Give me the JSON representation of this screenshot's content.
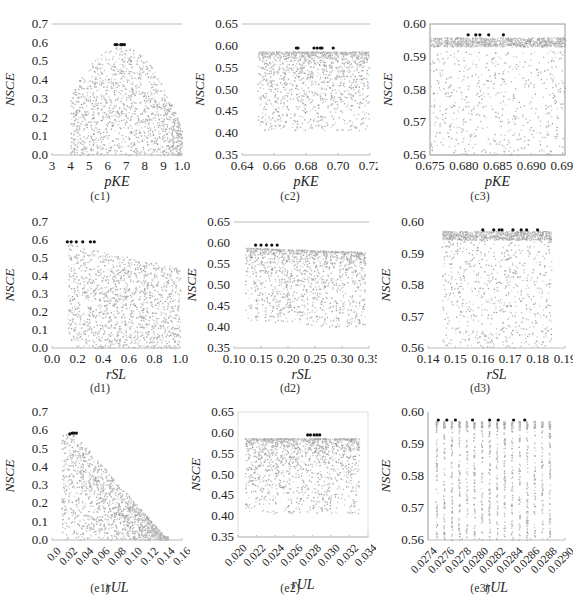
{
  "figure": {
    "panels": [
      {
        "id": "c1",
        "caption": "(c1)",
        "xlabel": "pKE",
        "ylabel": "NSCE",
        "xticks": [
          "3",
          "4",
          "5",
          "6",
          "7",
          "8",
          "9",
          "1.0"
        ],
        "yticks": [
          "0.0",
          "0.1",
          "0.2",
          "0.3",
          "0.4",
          "0.5",
          "0.6",
          "0.7"
        ]
      },
      {
        "id": "c2",
        "caption": "(c2)",
        "xlabel": "pKE",
        "ylabel": "NSCE",
        "xticks": [
          "0.64",
          "0.66",
          "0.68",
          "0.70",
          "0.72"
        ],
        "yticks": [
          "0.35",
          "0.40",
          "0.45",
          "0.50",
          "0.55",
          "0.60",
          "0.65"
        ]
      },
      {
        "id": "c3",
        "caption": "(c3)",
        "xlabel": "pKE",
        "ylabel": "NSCE",
        "xticks": [
          "0.675",
          "0.680",
          "0.685",
          "0.690",
          "0.695"
        ],
        "yticks": [
          "0.56",
          "0.57",
          "0.58",
          "0.59",
          "0.60"
        ]
      },
      {
        "id": "d1",
        "caption": "(d1)",
        "xlabel": "rSL",
        "ylabel": "NSCE",
        "xticks": [
          "0.0",
          "0.2",
          "0.4",
          "0.6",
          "0.8",
          "1.0"
        ],
        "yticks": [
          "0.0",
          "0.1",
          "0.2",
          "0.3",
          "0.4",
          "0.5",
          "0.6",
          "0.7"
        ]
      },
      {
        "id": "d2",
        "caption": "(d2)",
        "xlabel": "rSL",
        "ylabel": "NSCE",
        "xticks": [
          "0.10",
          "0.15",
          "0.20",
          "0.25",
          "0.30",
          "0.35"
        ],
        "yticks": [
          "0.35",
          "0.40",
          "0.45",
          "0.50",
          "0.55",
          "0.60",
          "0.65"
        ]
      },
      {
        "id": "d3",
        "caption": "(d3)",
        "xlabel": "rSL",
        "ylabel": "NSCE",
        "xticks": [
          "0.14",
          "0.15",
          "0.16",
          "0.17",
          "0.18",
          "0.19"
        ],
        "yticks": [
          "0.56",
          "0.57",
          "0.58",
          "0.59",
          "0.60"
        ]
      },
      {
        "id": "e1",
        "caption": "(e1)",
        "xlabel": "rUL",
        "ylabel": "NSCE",
        "xticks": [
          "0.0",
          "0.02",
          "0.04",
          "0.06",
          "0.08",
          "0.10",
          "0.12",
          "0.14",
          "0.16"
        ],
        "yticks": [
          "0.0",
          "0.1",
          "0.2",
          "0.3",
          "0.4",
          "0.5",
          "0.6",
          "0.7"
        ]
      },
      {
        "id": "e2",
        "caption": "(e2)",
        "xlabel": "rUL",
        "ylabel": "NSCE",
        "xticks": [
          "0.020",
          "0.022",
          "0.024",
          "0.026",
          "0.028",
          "0.030",
          "0.032",
          "0.034"
        ],
        "yticks": [
          "0.35",
          "0.40",
          "0.45",
          "0.50",
          "0.55",
          "0.60",
          "0.65"
        ]
      },
      {
        "id": "e3",
        "caption": "(e3)",
        "xlabel": "rUL",
        "ylabel": "NSCE",
        "xticks": [
          "0.0274",
          "0.0276",
          "0.0278",
          "0.0280",
          "0.0282",
          "0.0284",
          "0.0286",
          "0.0288",
          "0.0290"
        ],
        "yticks": [
          "0.56",
          "0.57",
          "0.58",
          "0.59",
          "0.60"
        ]
      }
    ]
  },
  "chart_data": [
    {
      "id": "c1",
      "type": "scatter",
      "title": "(c1)",
      "xlabel": "pKE",
      "ylabel": "NSCE",
      "xlim": [
        0.3,
        1.0
      ],
      "ylim": [
        0.0,
        0.7
      ],
      "grid": false,
      "tick_labels_x": [
        "3",
        "4",
        "5",
        "6",
        "7",
        "8",
        "9",
        "1.0"
      ],
      "description": "Dense gray cloud shaped like a dome; max NSCE ~0.59 at pKE ~0.65-0.70; best (black) points at ~0.59",
      "best_points": {
        "x": [
          0.64,
          0.65,
          0.67,
          0.68,
          0.69
        ],
        "y": [
          0.59,
          0.59,
          0.59,
          0.59,
          0.59
        ]
      }
    },
    {
      "id": "c2",
      "type": "scatter",
      "title": "(c2)",
      "xlabel": "pKE",
      "ylabel": "NSCE",
      "xlim": [
        0.64,
        0.72
      ],
      "ylim": [
        0.35,
        0.65
      ],
      "grid": false,
      "description": "Band of points 0.65-0.72 concentrated at NSCE 0.55-0.59, sparse down to ~0.40",
      "best_points": {
        "x": [
          0.674,
          0.675,
          0.685,
          0.687,
          0.689,
          0.69,
          0.697
        ],
        "y": [
          0.595,
          0.595,
          0.595,
          0.595,
          0.595,
          0.595,
          0.595
        ]
      }
    },
    {
      "id": "c3",
      "type": "scatter",
      "title": "(c3)",
      "xlabel": "pKE",
      "ylabel": "NSCE",
      "xlim": [
        0.675,
        0.698
      ],
      "ylim": [
        0.56,
        0.6
      ],
      "grid": false,
      "description": "Dense band at NSCE 0.593-0.596; sparse points below; a faint declining trail from 0.574 to 0.566",
      "best_points": {
        "x": [
          0.6815,
          0.6828,
          0.6835,
          0.685,
          0.6875
        ],
        "y": [
          0.5967,
          0.5967,
          0.5967,
          0.5967,
          0.5967
        ]
      }
    },
    {
      "id": "d1",
      "type": "scatter",
      "title": "(d1)",
      "xlabel": "rSL",
      "ylabel": "NSCE",
      "xlim": [
        0.0,
        1.0
      ],
      "ylim": [
        0.0,
        0.7
      ],
      "grid": false,
      "description": "Cloud spanning rSL 0.1-1.0; upper envelope declines from ~0.58 to ~0.45",
      "best_points": {
        "x": [
          0.12,
          0.15,
          0.19,
          0.24,
          0.3,
          0.33
        ],
        "y": [
          0.59,
          0.59,
          0.59,
          0.59,
          0.59,
          0.59
        ]
      }
    },
    {
      "id": "d2",
      "type": "scatter",
      "title": "(d2)",
      "xlabel": "rSL",
      "ylabel": "NSCE",
      "xlim": [
        0.1,
        0.35
      ],
      "ylim": [
        0.35,
        0.65
      ],
      "grid": false,
      "description": "Band rSL 0.12-0.34, NSCE concentrated 0.55-0.59, sparse down to ~0.41",
      "best_points": {
        "x": [
          0.14,
          0.15,
          0.16,
          0.17,
          0.18
        ],
        "y": [
          0.595,
          0.595,
          0.595,
          0.595,
          0.595
        ]
      }
    },
    {
      "id": "d3",
      "type": "scatter",
      "title": "(d3)",
      "xlabel": "rSL",
      "ylabel": "NSCE",
      "xlim": [
        0.14,
        0.19
      ],
      "ylim": [
        0.56,
        0.6
      ],
      "grid": false,
      "description": "Dense band at 0.595-0.597 for rSL 0.145-0.185; sparse points below",
      "best_points": {
        "x": [
          0.16,
          0.164,
          0.166,
          0.167,
          0.171,
          0.174,
          0.176,
          0.18
        ],
        "y": [
          0.5975,
          0.5975,
          0.5975,
          0.5975,
          0.5975,
          0.5975,
          0.5975,
          0.5975
        ]
      }
    },
    {
      "id": "e1",
      "type": "scatter",
      "title": "(e1)",
      "xlabel": "rUL",
      "ylabel": "NSCE",
      "xlim": [
        0.0,
        0.16
      ],
      "ylim": [
        0.0,
        0.7
      ],
      "grid": false,
      "description": "Triangular cloud; peak ~0.58 at rUL ~0.025, declining to 0 at rUL ~0.14",
      "best_points": {
        "x": [
          0.022,
          0.025,
          0.027,
          0.03
        ],
        "y": [
          0.58,
          0.585,
          0.585,
          0.585
        ]
      }
    },
    {
      "id": "e2",
      "type": "scatter",
      "title": "(e2)",
      "xlabel": "rUL",
      "ylabel": "NSCE",
      "xlim": [
        0.02,
        0.034
      ],
      "ylim": [
        0.35,
        0.65
      ],
      "grid": false,
      "description": "Band rUL 0.020-0.033 concentrated 0.53-0.59; sparse down to ~0.40",
      "best_points": {
        "x": [
          0.0275,
          0.0278,
          0.0282,
          0.0285,
          0.0288
        ],
        "y": [
          0.595,
          0.595,
          0.595,
          0.595,
          0.595
        ]
      }
    },
    {
      "id": "e3",
      "type": "scatter",
      "title": "(e3)",
      "xlabel": "rUL",
      "ylabel": "NSCE",
      "xlim": [
        0.0274,
        0.029
      ],
      "ylim": [
        0.56,
        0.6
      ],
      "grid": false,
      "description": "Vertical streaks of points at discrete rUL values; best points at top ~0.5975",
      "best_points": {
        "x": [
          0.02752,
          0.02762,
          0.02772,
          0.02792,
          0.02812,
          0.02822,
          0.0284,
          0.02853
        ],
        "y": [
          0.5975,
          0.5975,
          0.5975,
          0.5975,
          0.5975,
          0.5975,
          0.5975,
          0.5975
        ]
      }
    }
  ]
}
